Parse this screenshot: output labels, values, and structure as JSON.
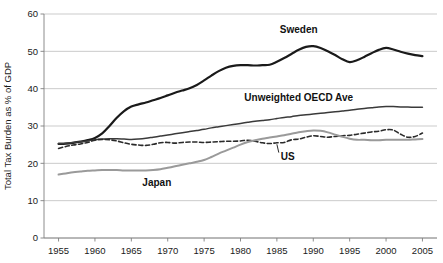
{
  "chart_data": {
    "type": "line",
    "title": "",
    "xlabel": "",
    "ylabel": "Total Tax Burden as % of GDP",
    "xlim": [
      1953,
      2007
    ],
    "ylim": [
      0,
      60
    ],
    "ytick_step": 10,
    "xtick_step": 5,
    "grid": true,
    "legend_position": "inline-annotations",
    "x_ticks": [
      "1955",
      "1960",
      "1965",
      "1970",
      "1975",
      "1980",
      "1985",
      "1990",
      "1995",
      "2000",
      "2005"
    ],
    "y_ticks": [
      "0",
      "10",
      "20",
      "30",
      "40",
      "50",
      "60"
    ],
    "x": [
      1955,
      1956,
      1957,
      1958,
      1959,
      1960,
      1961,
      1962,
      1963,
      1964,
      1965,
      1966,
      1967,
      1968,
      1969,
      1970,
      1971,
      1972,
      1973,
      1974,
      1975,
      1976,
      1977,
      1978,
      1979,
      1980,
      1981,
      1982,
      1983,
      1984,
      1985,
      1986,
      1987,
      1988,
      1989,
      1990,
      1991,
      1992,
      1993,
      1994,
      1995,
      1996,
      1997,
      1998,
      1999,
      2000,
      2001,
      2002,
      2003,
      2004,
      2005
    ],
    "series": [
      {
        "name": "Sweden",
        "label": "Sweden",
        "color": "#1a1a1a",
        "style": "solid",
        "width": 2.2,
        "label_x": 1988,
        "label_y": 55.0,
        "values": [
          25.2,
          25.3,
          25.5,
          25.8,
          26.2,
          26.8,
          28.0,
          30.0,
          32.2,
          34.0,
          35.2,
          35.8,
          36.3,
          36.9,
          37.5,
          38.2,
          38.9,
          39.5,
          40.1,
          41.0,
          42.2,
          43.5,
          44.7,
          45.6,
          46.1,
          46.3,
          46.3,
          46.2,
          46.3,
          46.4,
          47.2,
          48.2,
          49.3,
          50.4,
          51.2,
          51.4,
          50.9,
          50.0,
          49.0,
          47.9,
          47.1,
          47.6,
          48.5,
          49.5,
          50.4,
          50.9,
          50.5,
          49.9,
          49.4,
          49.0,
          48.7
        ]
      },
      {
        "name": "Unweighted OECD Ave",
        "label": "Unweighted OECD Ave",
        "color": "#3a3a3a",
        "style": "solid",
        "width": 1.5,
        "label_x": 1988,
        "label_y": 36.6,
        "values": [
          25.3,
          25.4,
          25.6,
          25.8,
          26.0,
          26.3,
          26.5,
          26.6,
          26.6,
          26.5,
          26.4,
          26.5,
          26.7,
          27.0,
          27.3,
          27.6,
          27.9,
          28.2,
          28.5,
          28.8,
          29.1,
          29.5,
          29.8,
          30.1,
          30.4,
          30.7,
          31.0,
          31.3,
          31.5,
          31.7,
          32.0,
          32.3,
          32.5,
          32.8,
          33.0,
          33.2,
          33.4,
          33.6,
          33.8,
          34.0,
          34.2,
          34.5,
          34.7,
          34.9,
          35.1,
          35.2,
          35.2,
          35.1,
          35.1,
          35.0,
          35.0
        ]
      },
      {
        "name": "US",
        "label": "US",
        "color": "#2a2a2a",
        "style": "dashed",
        "width": 1.6,
        "label_x": 1986.5,
        "label_y": 21.0,
        "values": [
          24.0,
          24.5,
          24.9,
          25.2,
          25.6,
          26.2,
          26.4,
          26.3,
          26.0,
          25.5,
          25.1,
          24.9,
          24.8,
          25.1,
          25.5,
          25.6,
          25.4,
          25.6,
          25.7,
          25.7,
          25.6,
          25.7,
          25.8,
          25.9,
          25.9,
          26.0,
          26.2,
          25.9,
          25.5,
          25.3,
          25.5,
          25.6,
          26.3,
          26.5,
          27.0,
          27.4,
          27.2,
          27.0,
          27.2,
          27.4,
          27.5,
          27.8,
          28.1,
          28.4,
          28.6,
          29.0,
          28.9,
          27.8,
          27.0,
          27.2,
          28.1
        ]
      },
      {
        "name": "Japan",
        "label": "Japan",
        "color": "#9a9a9a",
        "style": "solid",
        "width": 2.0,
        "label_x": 1968.5,
        "label_y": 14.0,
        "values": [
          17.0,
          17.3,
          17.6,
          17.8,
          18.0,
          18.1,
          18.2,
          18.2,
          18.2,
          18.1,
          18.1,
          18.1,
          18.1,
          18.2,
          18.4,
          18.8,
          19.2,
          19.6,
          20.0,
          20.4,
          20.9,
          21.7,
          22.6,
          23.4,
          24.2,
          25.0,
          25.7,
          26.2,
          26.6,
          26.9,
          27.2,
          27.5,
          27.9,
          28.3,
          28.6,
          28.8,
          28.7,
          28.3,
          27.7,
          27.1,
          26.6,
          26.3,
          26.3,
          26.2,
          26.2,
          26.3,
          26.3,
          26.3,
          26.3,
          26.4,
          26.5
        ]
      }
    ]
  }
}
